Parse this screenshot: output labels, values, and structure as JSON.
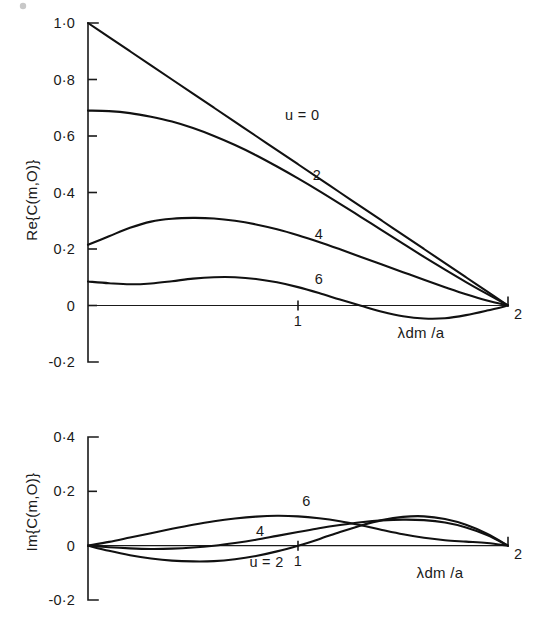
{
  "figure": {
    "background": "#ffffff",
    "ink_color": "#111111"
  },
  "chart_data": [
    {
      "type": "line",
      "panel": "upper",
      "title": "",
      "xlabel": "λdm /a",
      "ylabel": "Re{C(m,O)}",
      "xlim": [
        0,
        2
      ],
      "ylim": [
        -0.2,
        1.0
      ],
      "xticks": [
        1,
        2
      ],
      "xticklabels": [
        "1",
        "2"
      ],
      "yticks": [
        -0.2,
        0,
        0.2,
        0.4,
        0.6,
        0.8,
        1.0
      ],
      "yticklabels": [
        "-0·2",
        "0",
        "0·2",
        "0·4",
        "0·6",
        "0·8",
        "1·0"
      ],
      "grid": false,
      "legend": "inline-curve-labels",
      "x": [
        0,
        0.1,
        0.2,
        0.3,
        0.4,
        0.5,
        0.6,
        0.7,
        0.8,
        0.9,
        1.0,
        1.1,
        1.2,
        1.3,
        1.4,
        1.5,
        1.6,
        1.7,
        1.8,
        1.9,
        2.0
      ],
      "series": [
        {
          "name": "u = 0",
          "label": "u = 0",
          "label_x": 1.02,
          "label_y": 0.655,
          "values": [
            1.0,
            0.95,
            0.9,
            0.85,
            0.8,
            0.75,
            0.7,
            0.65,
            0.6,
            0.55,
            0.5,
            0.45,
            0.4,
            0.35,
            0.3,
            0.25,
            0.2,
            0.15,
            0.1,
            0.05,
            0.0
          ]
        },
        {
          "name": "u = 2",
          "label": "2",
          "label_x": 1.09,
          "label_y": 0.445,
          "values": [
            0.69,
            0.688,
            0.681,
            0.668,
            0.651,
            0.628,
            0.6,
            0.568,
            0.532,
            0.492,
            0.45,
            0.406,
            0.36,
            0.313,
            0.266,
            0.219,
            0.172,
            0.127,
            0.083,
            0.041,
            0.0
          ]
        },
        {
          "name": "u = 4",
          "label": "4",
          "label_x": 1.1,
          "label_y": 0.235,
          "values": [
            0.215,
            0.245,
            0.275,
            0.297,
            0.307,
            0.31,
            0.308,
            0.3,
            0.287,
            0.27,
            0.249,
            0.225,
            0.199,
            0.172,
            0.145,
            0.118,
            0.091,
            0.065,
            0.04,
            0.018,
            0.0
          ]
        },
        {
          "name": "u = 6",
          "label": "6",
          "label_x": 1.1,
          "label_y": 0.075,
          "values": [
            0.085,
            0.079,
            0.075,
            0.078,
            0.086,
            0.095,
            0.1,
            0.1,
            0.094,
            0.082,
            0.065,
            0.044,
            0.021,
            -0.001,
            -0.022,
            -0.038,
            -0.046,
            -0.045,
            -0.034,
            -0.018,
            0.0
          ]
        }
      ]
    },
    {
      "type": "line",
      "panel": "lower",
      "title": "",
      "xlabel": "λdm /a",
      "ylabel": "Im{C(m,O)}",
      "xlim": [
        0,
        2
      ],
      "ylim": [
        -0.2,
        0.4
      ],
      "xticks": [
        1,
        2
      ],
      "xticklabels": [
        "1",
        "2"
      ],
      "yticks": [
        -0.2,
        0,
        0.2,
        0.4
      ],
      "yticklabels": [
        "-0·2",
        "0",
        "0·2",
        "0·4"
      ],
      "grid": false,
      "legend": "inline-curve-labels",
      "x": [
        0,
        0.1,
        0.2,
        0.3,
        0.4,
        0.5,
        0.6,
        0.7,
        0.8,
        0.9,
        1.0,
        1.1,
        1.2,
        1.3,
        1.4,
        1.5,
        1.6,
        1.7,
        1.8,
        1.9,
        2.0
      ],
      "series": [
        {
          "name": "u = 2",
          "label": "u = 2",
          "label_x": 0.85,
          "label_y": -0.077,
          "values": [
            0.0,
            -0.019,
            -0.035,
            -0.047,
            -0.055,
            -0.058,
            -0.057,
            -0.05,
            -0.038,
            -0.021,
            0.0,
            0.024,
            0.05,
            0.074,
            0.094,
            0.106,
            0.108,
            0.098,
            0.077,
            0.044,
            0.0
          ]
        },
        {
          "name": "u = 4",
          "label": "4",
          "label_x": 0.82,
          "label_y": 0.035,
          "values": [
            0.0,
            -0.006,
            -0.01,
            -0.012,
            -0.011,
            -0.007,
            0.0,
            0.01,
            0.022,
            0.036,
            0.05,
            0.064,
            0.076,
            0.086,
            0.093,
            0.096,
            0.094,
            0.085,
            0.067,
            0.039,
            0.0
          ]
        },
        {
          "name": "u = 6",
          "label": "6",
          "label_x": 1.04,
          "label_y": 0.147,
          "values": [
            0.0,
            0.014,
            0.03,
            0.046,
            0.062,
            0.077,
            0.09,
            0.1,
            0.107,
            0.11,
            0.108,
            0.101,
            0.09,
            0.075,
            0.058,
            0.042,
            0.029,
            0.02,
            0.015,
            0.01,
            0.0
          ]
        }
      ]
    }
  ]
}
